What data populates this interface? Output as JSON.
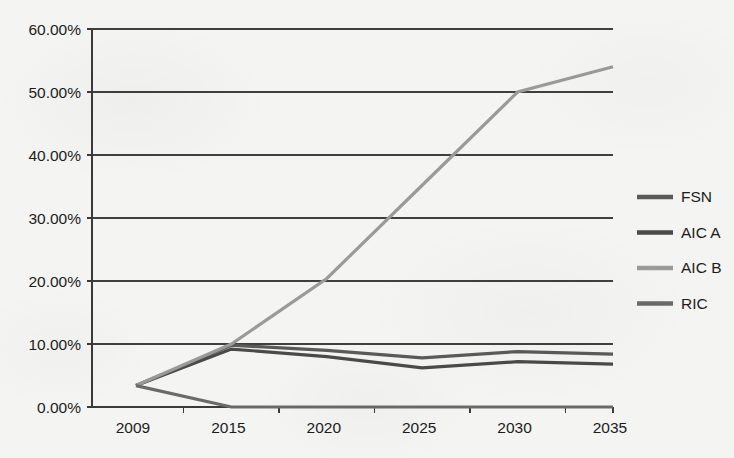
{
  "chart_data": {
    "type": "line",
    "title": "",
    "xlabel": "",
    "ylabel": "",
    "categories": [
      "2009",
      "2015",
      "2020",
      "2025",
      "2030",
      "2035"
    ],
    "x_tick_labels": [
      "2009",
      "2015",
      "2020",
      "2025",
      "2030",
      "2035"
    ],
    "y_tick_labels": [
      "0.00%",
      "10.00%",
      "20.00%",
      "30.00%",
      "40.00%",
      "50.00%",
      "60.00%"
    ],
    "y_tick_values": [
      0,
      10,
      20,
      30,
      40,
      50,
      60
    ],
    "ylim": [
      0,
      60
    ],
    "y_axis_format": "percent",
    "grid": "horizontal",
    "legend_position": "right",
    "series": [
      {
        "name": "FSN",
        "color": "#5a5a5a",
        "values": [
          3.4,
          9.8,
          9.0,
          7.8,
          8.8,
          8.4
        ]
      },
      {
        "name": "AIC A",
        "color": "#4a4a4a",
        "values": [
          3.4,
          9.2,
          8.0,
          6.2,
          7.2,
          6.8
        ]
      },
      {
        "name": "AIC B",
        "color": "#9a9a9a",
        "values": [
          3.4,
          10.0,
          20.4,
          35.2,
          50.0,
          54.0
        ]
      },
      {
        "name": "RIC",
        "color": "#6a6a6a",
        "values": [
          3.4,
          0.0,
          0.0,
          0.0,
          0.0,
          0.0
        ]
      }
    ]
  },
  "legend": {
    "entries": [
      {
        "label": "FSN",
        "color": "#5a5a5a"
      },
      {
        "label": "AIC A",
        "color": "#4a4a4a"
      },
      {
        "label": "AIC B",
        "color": "#9a9a9a"
      },
      {
        "label": "RIC",
        "color": "#6a6a6a"
      }
    ]
  },
  "colors": {
    "background": "#f4f4f2",
    "axis": "#3a3a3a",
    "gridline": "#3f3f3f",
    "text": "#1c1c1c"
  }
}
